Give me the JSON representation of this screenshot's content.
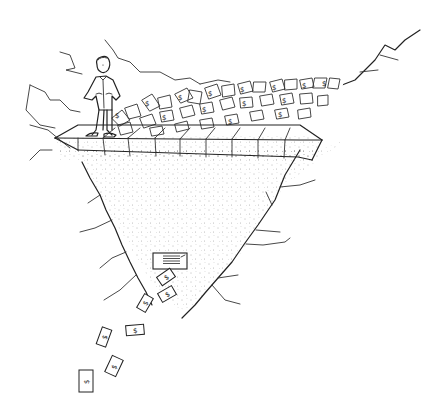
{
  "illustration": {
    "subject": "Man standing on a stone walkway at the edge of a funnel-shaped chasm; a pile of dollar bills sits on the walkway and bills drain out of a small box at the bottom of the funnel",
    "style": "hand-drawn black ink line art with stippled shading",
    "colors": {
      "ink": "#222222",
      "background": "#ffffff",
      "stipple": "#555555"
    },
    "bill_symbol": "$",
    "walkway_blocks": 8,
    "falling_bills": 7
  }
}
